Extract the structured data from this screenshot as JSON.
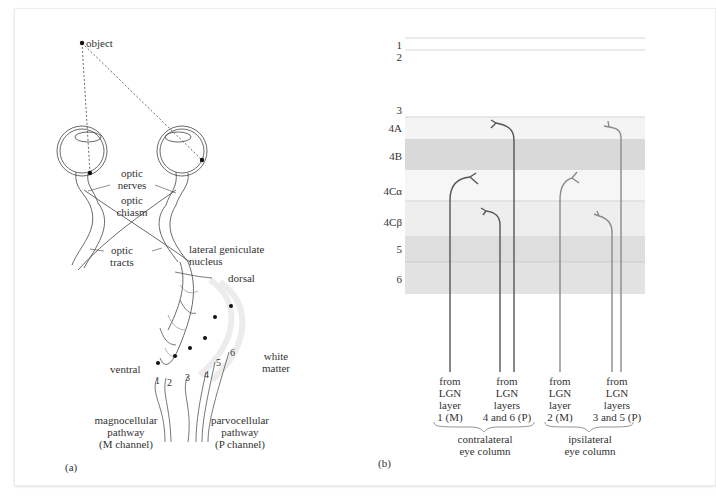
{
  "panel_a": {
    "label": "(a)",
    "object": "object",
    "optic_nerves": [
      "optic",
      "nerves"
    ],
    "optic_chiasm": [
      "optic",
      "chiasm"
    ],
    "optic_tracts": [
      "optic",
      "tracts"
    ],
    "lgn": [
      "lateral geniculate",
      "nucleus"
    ],
    "dorsal": "dorsal",
    "ventral": "ventral",
    "white_matter": [
      "white",
      "matter"
    ],
    "layers": [
      "1",
      "2",
      "3",
      "4",
      "5",
      "6"
    ],
    "magno": [
      "magnocellular",
      "pathway",
      "(M channel)"
    ],
    "parvo": [
      "parvocellular",
      "pathway",
      "(P channel)"
    ]
  },
  "panel_b": {
    "label": "(b)",
    "cortex_layers": [
      "1",
      "2",
      "3",
      "4A",
      "4B",
      "4Cα",
      "4Cβ",
      "5",
      "6"
    ],
    "sources": [
      {
        "lines": [
          "from",
          "LGN",
          "layer",
          "1 (M)"
        ]
      },
      {
        "lines": [
          "from",
          "LGN",
          "layers",
          "4 and 6 (P)"
        ]
      },
      {
        "lines": [
          "from",
          "LGN",
          "layer",
          "2 (M)"
        ]
      },
      {
        "lines": [
          "from",
          "LGN",
          "layers",
          "3 and 5 (P)"
        ]
      }
    ],
    "columns": [
      {
        "lines": [
          "contralateral",
          "eye column"
        ]
      },
      {
        "lines": [
          "ipsilateral",
          "eye column"
        ]
      }
    ],
    "colors": {
      "band_light": "#f4f4f4",
      "band_mid": "#ececec",
      "band_dark": "#d9d9d9",
      "contra_axon": "#555555",
      "ipsi_axon": "#8a8a8a"
    }
  }
}
